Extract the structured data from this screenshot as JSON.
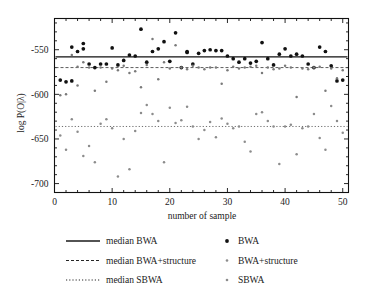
{
  "chart_data": {
    "type": "scatter",
    "title": "",
    "xlabel": "number of sample",
    "ylabel": "log P(O|λ)",
    "xlim": [
      0,
      51
    ],
    "ylim": [
      -710,
      -515
    ],
    "xticks": [
      0,
      10,
      20,
      30,
      40,
      50
    ],
    "yticks": [
      -550,
      -600,
      -650,
      -700
    ],
    "xtick_labels": [
      "0",
      "10",
      "20",
      "30",
      "40",
      "50"
    ],
    "ytick_labels": [
      "-550",
      "-600",
      "-650",
      "-700"
    ],
    "x_minor_step": 2,
    "y_minor_step": 10,
    "grid": false,
    "legend_position": "below",
    "series": [
      {
        "name": "BWA",
        "marker": "dot-large",
        "color": "#111111",
        "x": [
          1,
          2,
          3,
          3,
          4,
          5,
          5,
          6,
          7,
          8,
          9,
          10,
          11,
          12,
          13,
          14,
          15,
          16,
          17,
          18,
          19,
          20,
          21,
          22,
          23,
          23,
          24,
          25,
          26,
          27,
          28,
          29,
          30,
          31,
          32,
          33,
          34,
          35,
          36,
          37,
          38,
          39,
          40,
          41,
          42,
          43,
          44,
          45,
          46,
          47,
          48,
          49,
          50
        ],
        "y": [
          -584,
          -586,
          -547,
          -585,
          -552,
          -549,
          -543,
          -566,
          -570,
          -566,
          -566,
          -548,
          -567,
          -562,
          -556,
          -557,
          -527,
          -564,
          -552,
          -549,
          -541,
          -563,
          -531,
          -570,
          -552,
          -553,
          -566,
          -554,
          -551,
          -550,
          -551,
          -551,
          -557,
          -560,
          -564,
          -560,
          -565,
          -563,
          -542,
          -560,
          -567,
          -555,
          -549,
          -557,
          -555,
          -557,
          -566,
          -570,
          -547,
          -552,
          -568,
          -585,
          -584
        ]
      },
      {
        "name": "BWA+structure",
        "marker": "dot-small",
        "color": "#7a7a7a",
        "x": [
          1,
          2,
          3,
          4,
          4,
          5,
          6,
          7,
          8,
          9,
          10,
          11,
          12,
          13,
          14,
          15,
          16,
          17,
          18,
          19,
          20,
          21,
          22,
          23,
          24,
          25,
          26,
          27,
          28,
          29,
          30,
          31,
          32,
          33,
          34,
          35,
          36,
          37,
          38,
          39,
          40,
          41,
          42,
          43,
          44,
          45,
          46,
          47,
          48,
          49,
          50
        ],
        "y": [
          -601,
          -600,
          -556,
          -569,
          -590,
          -564,
          -570,
          -596,
          -570,
          -586,
          -571,
          -573,
          -568,
          -576,
          -574,
          -592,
          -567,
          -538,
          -583,
          -564,
          -571,
          -545,
          -570,
          -572,
          -568,
          -570,
          -572,
          -570,
          -570,
          -588,
          -573,
          -569,
          -571,
          -570,
          -569,
          -568,
          -576,
          -570,
          -572,
          -571,
          -568,
          -570,
          -603,
          -571,
          -572,
          -570,
          -569,
          -596,
          -571,
          -582,
          -573
        ]
      },
      {
        "name": "SBWA",
        "marker": "dot-small",
        "color": "#8c8c8c",
        "x": [
          1,
          2,
          3,
          4,
          5,
          6,
          7,
          8,
          9,
          10,
          11,
          12,
          13,
          14,
          15,
          16,
          17,
          18,
          19,
          20,
          21,
          22,
          23,
          24,
          25,
          26,
          27,
          28,
          29,
          30,
          31,
          32,
          33,
          34,
          35,
          36,
          37,
          38,
          39,
          40,
          41,
          42,
          43,
          44,
          45,
          46,
          47,
          48,
          49,
          50
        ],
        "y": [
          -646,
          -662,
          -628,
          -642,
          -669,
          -658,
          -676,
          -633,
          -628,
          -638,
          -692,
          -650,
          -684,
          -641,
          -621,
          -612,
          -622,
          -630,
          -676,
          -615,
          -632,
          -629,
          -614,
          -636,
          -650,
          -640,
          -631,
          -648,
          -627,
          -633,
          -638,
          -636,
          -653,
          -664,
          -622,
          -620,
          -630,
          -636,
          -678,
          -636,
          -634,
          -667,
          -638,
          -636,
          -622,
          -649,
          -662,
          -613,
          -630,
          -643
        ]
      }
    ],
    "reference_lines": [
      {
        "name": "median BWA",
        "value": -558,
        "style": "solid",
        "color": "#111111"
      },
      {
        "name": "median BWA+structure",
        "value": -570,
        "style": "dashed",
        "color": "#555555"
      },
      {
        "name": "median SBWA",
        "value": -636,
        "style": "dotted",
        "color": "#666666"
      }
    ],
    "legend": {
      "left_column": [
        {
          "label": "median BWA",
          "style": "solid"
        },
        {
          "label": "median BWA+structure",
          "style": "dashed"
        },
        {
          "label": "median SBWA",
          "style": "dotted"
        }
      ],
      "right_column": [
        {
          "label": "BWA",
          "marker": "dot-large"
        },
        {
          "label": "BWA+structure",
          "marker": "dot-small"
        },
        {
          "label": "SBWA",
          "marker": "dot-small"
        }
      ]
    }
  },
  "colors": {
    "frame": "#111111",
    "bwa": "#111111",
    "bwa_structure": "#7a7a7a",
    "sbwa": "#8c8c8c",
    "background": "#ffffff"
  }
}
